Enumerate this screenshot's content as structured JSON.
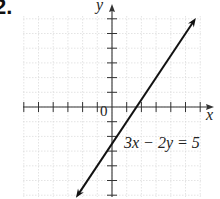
{
  "problem": {
    "number": "2."
  },
  "chart_data": {
    "type": "line",
    "title": "",
    "xlabel": "x",
    "ylabel": "y",
    "origin_label": "0",
    "xlim": [
      -6,
      6
    ],
    "ylim": [
      -6,
      6
    ],
    "grid": true,
    "tick_spacing": 1,
    "series": [
      {
        "name": "3x - 2y = 5",
        "equation": "3x − 2y = 5",
        "slope": 1.5,
        "y_intercept": -2.5,
        "x_intercept": 1.667,
        "points": [
          [
            -2.25,
            -5.875
          ],
          [
            0,
            -2.5
          ],
          [
            1.667,
            0
          ],
          [
            5.5,
            5.75
          ]
        ],
        "arrows": "both"
      }
    ],
    "annotations": [
      {
        "text": "3x − 2y = 5",
        "x": 0.7,
        "y": -2.7
      }
    ]
  },
  "style": {
    "line_color": "#111111",
    "grid_color": "#d8d8d8",
    "axis_color": "#333333"
  }
}
